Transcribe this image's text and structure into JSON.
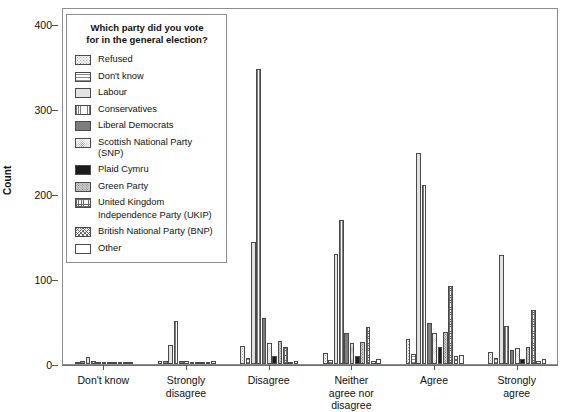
{
  "chart_data": {
    "type": "bar",
    "title": "",
    "subtitle": "",
    "xlabel": "",
    "ylabel": "Count",
    "ylim": [
      0,
      420
    ],
    "yticks": [
      0,
      100,
      200,
      300,
      400
    ],
    "grid": false,
    "legend_position": "upper-left-inside",
    "legend_title": "Which party did you vote for in the general election?",
    "categories": [
      "Don't know",
      "Strongly disagree",
      "Disagree",
      "Neither agree nor disagree",
      "Agree",
      "Strongly agree"
    ],
    "series": [
      {
        "name": "Refused",
        "pattern": "dotted-coarse",
        "values": [
          1,
          4,
          21,
          13,
          30,
          14
        ]
      },
      {
        "name": "Don't know",
        "pattern": "horizontal-lines",
        "values": [
          3,
          3,
          7,
          5,
          12,
          7
        ]
      },
      {
        "name": "Labour",
        "pattern": "light-solid",
        "values": [
          8,
          22,
          143,
          130,
          248,
          128
        ]
      },
      {
        "name": "Conservatives",
        "pattern": "vertical-lines",
        "values": [
          4,
          51,
          347,
          170,
          211,
          45
        ]
      },
      {
        "name": "Liberal Democrats",
        "pattern": "dark-solid",
        "values": [
          2,
          4,
          54,
          37,
          48,
          17
        ]
      },
      {
        "name": "Scottish National Party (SNP)",
        "pattern": "fine-dots",
        "values": [
          1,
          3,
          25,
          25,
          37,
          19
        ]
      },
      {
        "name": "Plaid Cymru",
        "pattern": "black-solid",
        "values": [
          1,
          1,
          10,
          10,
          20,
          6
        ]
      },
      {
        "name": "Green Party",
        "pattern": "checker-dots",
        "values": [
          2,
          2,
          27,
          26,
          38,
          20
        ]
      },
      {
        "name": "United Kingdom Independence Party (UKIP)",
        "pattern": "grid-crosshatch",
        "values": [
          1,
          2,
          20,
          44,
          92,
          64
        ]
      },
      {
        "name": "British National Party (BNP)",
        "pattern": "diagonal-hatch",
        "values": [
          0,
          1,
          2,
          4,
          10,
          4
        ]
      },
      {
        "name": "Other",
        "pattern": "white-empty",
        "values": [
          1,
          3,
          4,
          6,
          11,
          6
        ]
      }
    ]
  },
  "axis": {
    "y_title": "Count",
    "y_ticks": [
      "0",
      "100",
      "200",
      "300",
      "400"
    ],
    "x_ticks": [
      "Don't know",
      "Strongly disagree",
      "Disagree",
      "Neither agree nor disagree",
      "Agree",
      "Strongly agree"
    ]
  },
  "legend": {
    "title_line1": "Which party did you vote",
    "title_line2": "for in the general election?",
    "items": [
      {
        "label": "Refused"
      },
      {
        "label": "Don't know"
      },
      {
        "label": "Labour"
      },
      {
        "label": "Conservatives"
      },
      {
        "label": "Liberal Democrats"
      },
      {
        "label": "Scottish National Party (SNP)"
      },
      {
        "label": "Plaid Cymru"
      },
      {
        "label": "Green Party"
      },
      {
        "label": "United Kingdom"
      },
      {
        "label": "Independence Party (UKIP)"
      },
      {
        "label": "British National Party (BNP)"
      },
      {
        "label": "Other"
      }
    ]
  }
}
